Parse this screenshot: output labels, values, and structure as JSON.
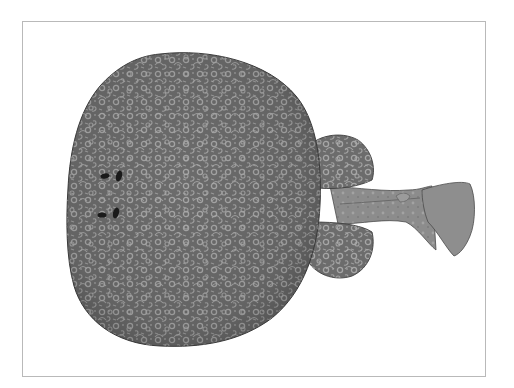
{
  "image": {
    "subject": "electric ray (torpedo ray), dorsal view illustration",
    "alt": "Grayscale illustration of a round-bodied electric ray seen from above, covered in a pale reticulated/ring-like pattern, with two small dark eyes and spiracles near the left edge, two pelvic fin lobes, and a short tail ending in a fan-shaped caudal fin on the right",
    "style": "monochrome stippled scientific drawing"
  },
  "frame": {
    "border_color": "#b9b9b9",
    "background": "#ffffff"
  },
  "colors": {
    "body_base": "#6f6f6f",
    "body_dark": "#5a5a5a",
    "pattern_light": "#a9a9a9",
    "outline": "#3e3e3e",
    "tail_base": "#8a8a8a",
    "eye": "#1a1a1a"
  }
}
